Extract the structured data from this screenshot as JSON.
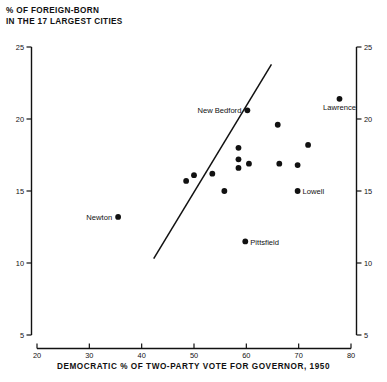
{
  "title": {
    "line1": "% OF FOREIGN-BORN",
    "line2": "IN THE 17 LARGEST CITIES"
  },
  "xaxis_title": "DEMOCRATIC % OF TWO-PARTY VOTE FOR GOVERNOR, 1950",
  "chart_data": {
    "type": "scatter",
    "title": "% OF FOREIGN-BORN IN THE 17 LARGEST CITIES",
    "xlabel": "DEMOCRATIC % OF TWO-PARTY VOTE FOR GOVERNOR, 1950",
    "ylabel": "% OF FOREIGN-BORN IN THE 17 LARGEST CITIES",
    "xlim": [
      20,
      80
    ],
    "ylim": [
      5,
      25
    ],
    "xticks": [
      20,
      30,
      40,
      50,
      60,
      70,
      80
    ],
    "yticks": [
      5,
      10,
      15,
      20,
      25
    ],
    "yticks_right": [
      5,
      10,
      15,
      20,
      25
    ],
    "grid": false,
    "legend": "none",
    "points": [
      {
        "label": "Newton",
        "x": 35.5,
        "y": 13.2,
        "label_pos": "left"
      },
      {
        "label": "",
        "x": 48.5,
        "y": 15.7,
        "label_pos": "none"
      },
      {
        "label": "",
        "x": 50.0,
        "y": 16.1,
        "label_pos": "none"
      },
      {
        "label": "",
        "x": 53.5,
        "y": 16.2,
        "label_pos": "none"
      },
      {
        "label": "",
        "x": 55.8,
        "y": 15.0,
        "label_pos": "none"
      },
      {
        "label": "",
        "x": 58.5,
        "y": 18.0,
        "label_pos": "none"
      },
      {
        "label": "",
        "x": 58.5,
        "y": 17.2,
        "label_pos": "none"
      },
      {
        "label": "",
        "x": 58.5,
        "y": 16.6,
        "label_pos": "none"
      },
      {
        "label": "",
        "x": 60.5,
        "y": 16.9,
        "label_pos": "none"
      },
      {
        "label": "Pittsfield",
        "x": 59.8,
        "y": 11.5,
        "label_pos": "right"
      },
      {
        "label": "New Bedford",
        "x": 60.2,
        "y": 20.6,
        "label_pos": "left"
      },
      {
        "label": "",
        "x": 66.0,
        "y": 19.6,
        "label_pos": "none"
      },
      {
        "label": "",
        "x": 66.3,
        "y": 16.9,
        "label_pos": "none"
      },
      {
        "label": "",
        "x": 69.8,
        "y": 16.8,
        "label_pos": "none"
      },
      {
        "label": "Lowell",
        "x": 69.8,
        "y": 15.0,
        "label_pos": "right"
      },
      {
        "label": "",
        "x": 71.8,
        "y": 18.2,
        "label_pos": "none"
      },
      {
        "label": "Lawrence",
        "x": 77.8,
        "y": 21.4,
        "label_pos": "below"
      }
    ],
    "fit_line": {
      "x0": 42.3,
      "y0": 10.3,
      "x1": 64.8,
      "y1": 23.8
    }
  }
}
